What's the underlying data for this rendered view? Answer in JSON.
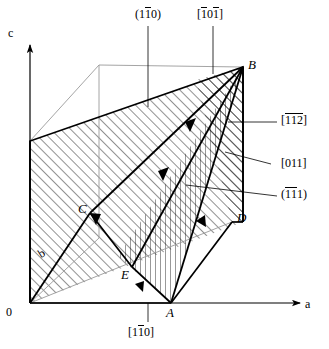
{
  "figure": {
    "kind": "crystallographic-unit-cell-diagram",
    "width": 329,
    "height": 349,
    "background_color": "#ffffff",
    "line_color": "#000000"
  },
  "axes": {
    "c": {
      "label": "c",
      "direction": "up"
    },
    "a": {
      "label": "a",
      "direction": "right"
    },
    "b": {
      "label": "b",
      "direction": "back-left-diagonal"
    },
    "origin": {
      "label": "0"
    }
  },
  "vertices": {
    "A": "A",
    "B": "B",
    "C": "C",
    "D": "D",
    "E": "E"
  },
  "annotations": {
    "plane_top_left": {
      "parts": [
        "(1",
        "1",
        "0)"
      ],
      "bar_on": [
        1
      ]
    },
    "direction_top_right": {
      "parts": [
        "[",
        "1",
        "0",
        "1",
        "]"
      ],
      "bar_on": [
        1,
        3
      ]
    },
    "direction_right_1": {
      "parts": [
        "[",
        "1",
        "1",
        "2",
        "]"
      ],
      "bar_on": [
        1,
        2,
        3
      ]
    },
    "direction_right_2": {
      "parts": [
        "[011]"
      ],
      "bar_on": []
    },
    "plane_right_3": {
      "parts": [
        "(",
        "1",
        "1",
        "1)"
      ],
      "bar_on": [
        1,
        2
      ]
    },
    "direction_bottom": {
      "parts": [
        "[1",
        "1",
        "0]"
      ],
      "bar_on": [
        1
      ]
    }
  },
  "labels_text": {
    "plane_110": "(1̅1̅0)",
    "dir_101": "[̅1 0 ̅1]",
    "dir_112": "[̅1 ̅1 ̅2]",
    "dir_011": "[011]",
    "plane_111": "(̅1 ̅1 1)",
    "dir_1b10": "[1 ̅1 0]"
  },
  "parts": {
    "plane110": {
      "p1": "(1",
      "p2": "1",
      "p3": "0)"
    },
    "dir101": {
      "p1": "[",
      "p2": "1",
      "p3": "0",
      "p4": "1",
      "p5": "]"
    },
    "dir112": {
      "p1": "[",
      "p2": "1",
      "p3": "1",
      "p4": "2",
      "p5": "]"
    },
    "dir011": {
      "p1": "[011]"
    },
    "plane111": {
      "p1": "(",
      "p2": "1",
      "p3": "1",
      "p4": "1)"
    },
    "dir1b10": {
      "p1": "[1",
      "p2": "1",
      "p3": "0]"
    }
  },
  "geometry": {
    "origin": [
      30,
      303
    ],
    "a_end": [
      222,
      303
    ],
    "A": [
      171,
      303
    ],
    "D": [
      232,
      222
    ],
    "B": [
      243,
      67
    ],
    "C": [
      90,
      213
    ],
    "E": [
      132,
      267
    ],
    "back_top_left": [
      99,
      65
    ],
    "left_top": [
      30,
      141
    ],
    "b_far": [
      99,
      238
    ]
  },
  "leaders": {
    "plane110_to": [
      148,
      105
    ],
    "dir101_to": [
      213,
      72
    ],
    "dir112_to": [
      223,
      120
    ],
    "dir011_to": [
      217,
      157
    ],
    "plane111_to": [
      180,
      185
    ],
    "dir1b10_to": [
      148,
      303
    ]
  },
  "hatching": {
    "diagonal_region": "45deg thin lines",
    "vertical_region": "vertical thin lines"
  }
}
